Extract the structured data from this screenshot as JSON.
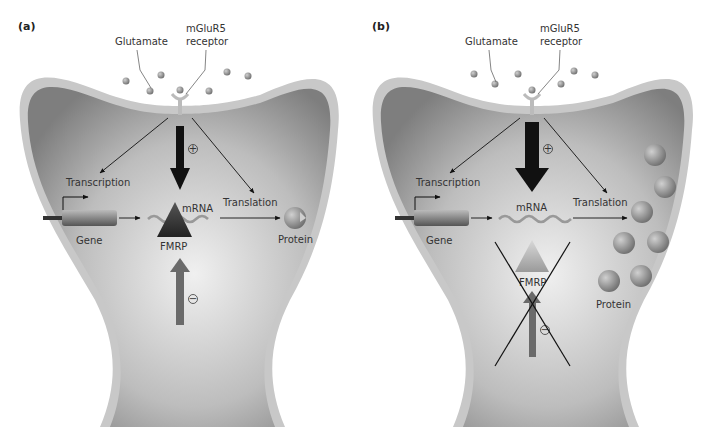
{
  "figure": {
    "panels": [
      {
        "id": "a",
        "label": "(a)",
        "glutamate_label": "Glutamate",
        "receptor_label_line1": "mGluR5",
        "receptor_label_line2": "receptor",
        "transcription_label": "Transcription",
        "translation_label": "Translation",
        "gene_label": "Gene",
        "mrna_label": "mRNA",
        "fmrp_label": "FMRP",
        "protein_label": "Protein",
        "plus_sign": "+",
        "minus_sign": "−",
        "fmrp_present": true,
        "protein_count": 1
      },
      {
        "id": "b",
        "label": "(b)",
        "glutamate_label": "Glutamate",
        "receptor_label_line1": "mGluR5",
        "receptor_label_line2": "receptor",
        "transcription_label": "Transcription",
        "translation_label": "Translation",
        "gene_label": "Gene",
        "mrna_label": "mRNA",
        "fmrp_label": "FMRP",
        "protein_label": "Protein",
        "plus_sign": "+",
        "minus_sign": "−",
        "fmrp_present": false,
        "protein_count": 7
      }
    ],
    "colors": {
      "membrane": "#c8c8c8",
      "cytoplasm_dark": "#8a8a8a",
      "cytoplasm_light": "#e8e8e8",
      "glutamate": "#8c8c8c",
      "activating_arrow": "#111111",
      "inhibiting_arrow": "#6a6a6a",
      "protein": "#7a7a7a",
      "text": "#333333"
    }
  }
}
